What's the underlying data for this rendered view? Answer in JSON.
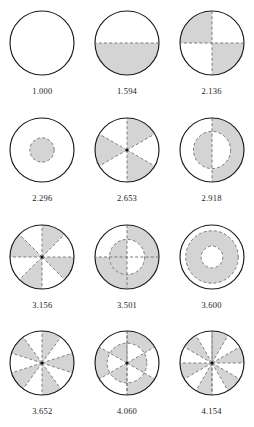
{
  "figure": {
    "columns": 3,
    "rows": 4,
    "style": {
      "shade_color": "#d4d4d4",
      "shade_stroke": "#8c8c8c",
      "outline_color": "#1a1a1a",
      "dash_color": "#6e6e6e",
      "background": "#ffffff",
      "label_color": "#1b1b1b"
    }
  },
  "chart_data": {
    "type": "diagram-grid",
    "xlabel": "",
    "ylabel": "",
    "categories": [
      "1.000",
      "1.594",
      "2.136",
      "2.296",
      "2.653",
      "2.918",
      "3.156",
      "3.501",
      "3.600",
      "3.652",
      "4.060",
      "4.154"
    ],
    "values": [
      1.0,
      1.594,
      2.136,
      2.296,
      2.653,
      2.918,
      3.156,
      3.501,
      3.6,
      3.652,
      4.06,
      4.154
    ],
    "cells": [
      {
        "label": "1.000",
        "pattern": "plain-circle",
        "sectors": 0,
        "rings": 1,
        "shaded_fraction": 0.0
      },
      {
        "label": "1.594",
        "pattern": "half-shaded",
        "sectors": 2,
        "rings": 1,
        "shaded_fraction": 0.5
      },
      {
        "label": "2.136",
        "pattern": "quadrant-checker",
        "sectors": 4,
        "rings": 1,
        "shaded_fraction": 0.5
      },
      {
        "label": "2.296",
        "pattern": "inner-disk-shaded",
        "sectors": 0,
        "rings": 2,
        "shaded_fraction": 0.25
      },
      {
        "label": "2.653",
        "pattern": "six-sectors-alternating",
        "sectors": 6,
        "rings": 1,
        "shaded_fraction": 0.5
      },
      {
        "label": "2.918",
        "pattern": "annulus-half-opposite",
        "sectors": 2,
        "rings": 2,
        "shaded_fraction": 0.5
      },
      {
        "label": "3.156",
        "pattern": "eight-sectors-alternating",
        "sectors": 8,
        "rings": 1,
        "shaded_fraction": 0.5
      },
      {
        "label": "3.501",
        "pattern": "annulus-quadrant-checker",
        "sectors": 4,
        "rings": 2,
        "shaded_fraction": 0.5
      },
      {
        "label": "3.600",
        "pattern": "middle-annulus-shaded",
        "sectors": 0,
        "rings": 3,
        "shaded_fraction": 0.45
      },
      {
        "label": "3.652",
        "pattern": "ten-sectors-alternating",
        "sectors": 10,
        "rings": 1,
        "shaded_fraction": 0.5
      },
      {
        "label": "4.060",
        "pattern": "annulus-six-sectors-alternating",
        "sectors": 6,
        "rings": 2,
        "shaded_fraction": 0.5
      },
      {
        "label": "4.154",
        "pattern": "twelve-sectors-alternating",
        "sectors": 12,
        "rings": 1,
        "shaded_fraction": 0.5
      }
    ]
  }
}
